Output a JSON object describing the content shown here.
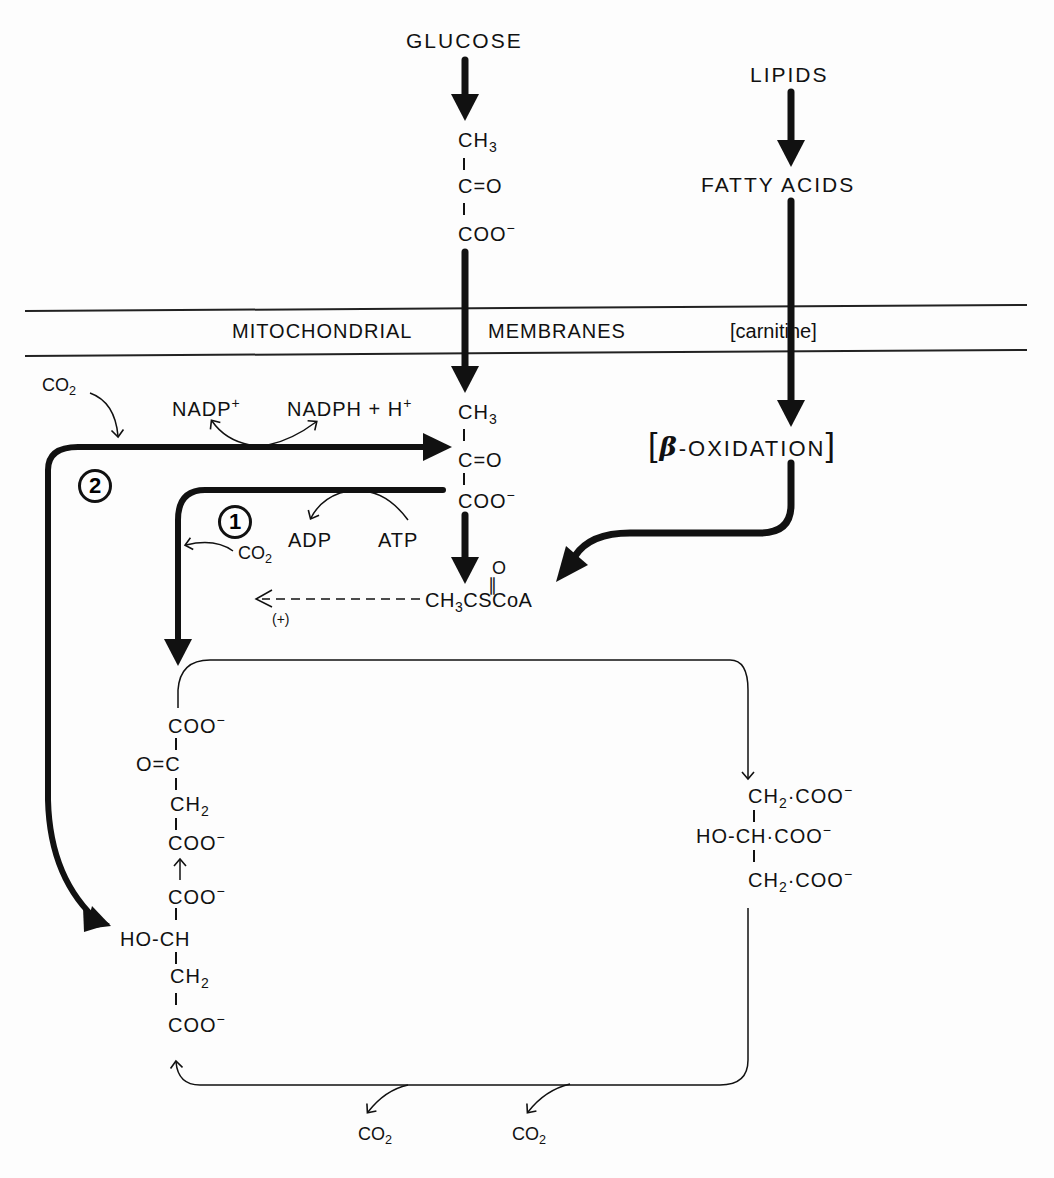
{
  "diagram": {
    "sources": {
      "glucose": "GLUCOSE",
      "lipids": "LIPIDS",
      "fatty_acids": "FATTY  ACIDS"
    },
    "membrane": {
      "label_1": "MITOCHONDRIAL",
      "label_2": "MEMBRANES",
      "carnitine": "[carnitine]"
    },
    "pyruvate_cytosol": {
      "line1": "CH",
      "line1_sub": "3",
      "line2": "C=O",
      "line3": "COO",
      "line3_sup": "−"
    },
    "pyruvate_mito": {
      "line1": "CH",
      "line1_sub": "3",
      "line2": "C=O",
      "line3": "COO",
      "line3_sup": "−"
    },
    "beta_oxidation": {
      "open": "[",
      "beta": "β",
      "text": "-OXIDATION",
      "close": "]"
    },
    "acetyl_coa": {
      "o_label": "O",
      "prefix": "CH",
      "sub": "3",
      "suffix": "CSCoA",
      "activation": "(+)"
    },
    "reaction_1": {
      "number": "1",
      "adp": "ADP",
      "atp": "ATP",
      "co2": "CO",
      "co2_sub": "2"
    },
    "reaction_2": {
      "number": "2",
      "co2": "CO",
      "co2_sub": "2",
      "nadp": "NADP",
      "nadp_sup": "+",
      "nadph": "NADPH + H",
      "nadph_sup": "+"
    },
    "oxaloacetate": {
      "line1": "COO",
      "line1_sup": "−",
      "line2": "O=C",
      "line3": "CH",
      "line3_sub": "2",
      "line4": "COO",
      "line4_sup": "−"
    },
    "malate": {
      "line1": "COO",
      "line1_sup": "−",
      "line2": "HO-CH",
      "line3": "CH",
      "line3_sub": "2",
      "line4": "COO",
      "line4_sup": "−"
    },
    "citrate": {
      "line1_a": "CH",
      "line1_sub": "2",
      "line1_b": "·COO",
      "line2": "HO-CH·COO",
      "line3_a": "CH",
      "line3_sub": "2",
      "line3_b": "·COO",
      "sup": "−"
    },
    "cycle_co2": {
      "left": "CO",
      "right": "CO",
      "sub": "2"
    }
  }
}
